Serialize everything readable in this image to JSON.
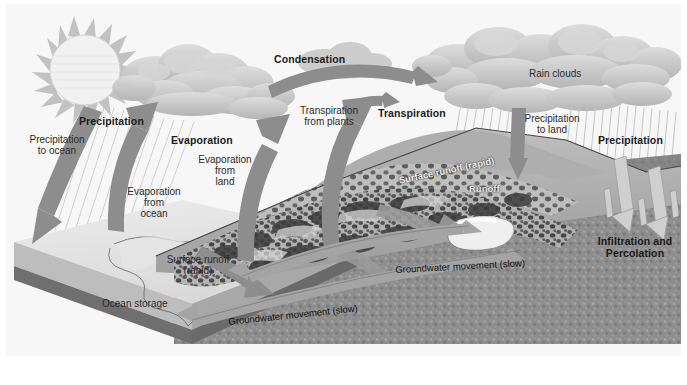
{
  "diagram": {
    "type": "hydrologic-cycle-illustration",
    "style": "grayscale",
    "colors": {
      "sky": "#f6f6f6",
      "arrow_gray": "#8a8a8a",
      "arrow_light": "#c9c9c9",
      "cloud": "#c6c6c6",
      "ocean_surface": "#e2e2e2",
      "ocean_edge": "#9a9a9a",
      "subsurface": "#8f8f8f",
      "terrain": "#b4b4b4",
      "lake": "#ececec",
      "text": "#1b1b1b",
      "text_white": "#f2f2f2"
    }
  },
  "labels": {
    "precipitation_to_ocean": "Precipitation\nto ocean",
    "precipitation_left": "Precipitation",
    "evaporation": "Evaporation",
    "evaporation_from_ocean": "Evaporation\nfrom\nocean",
    "evaporation_from_land": "Evaporation\nfrom\nland",
    "condensation": "Condensation",
    "transpiration_from_plants": "Transpiration\nfrom plants",
    "transpiration": "Transpiration",
    "rain_clouds": "Rain clouds",
    "precipitation_to_land": "Precipitation\nto land",
    "precipitation_right": "Precipitation",
    "infiltration_and_percolation": "Infiltration and\nPercolation",
    "surface_runoff_rapid_ocean": "Surface runoff\n(rapid)",
    "surface_runoff_rapid_hill": "Surface runoff (rapid)",
    "runoff": "Runoff",
    "ocean_storage": "Ocean storage",
    "groundwater_movement_upper": "Groundwater movement (slow)",
    "groundwater_movement_lower": "Groundwater movement (slow)"
  },
  "elements": {
    "sun": "sun-icon",
    "clouds_left": "cloud-cluster-left",
    "clouds_right": "rain-cloud-cluster-right",
    "rain_left": "rain-streaks-ocean",
    "rain_right": "rain-streaks-land",
    "ocean_block": "ocean-water-body",
    "terrain": "land-terrain-hills",
    "lake": "lake-reservoir",
    "subsurface": "groundwater-aquifer"
  }
}
